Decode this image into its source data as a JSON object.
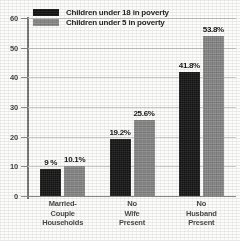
{
  "chart_data": {
    "type": "bar",
    "title": "",
    "subtitle": "",
    "xlabel": "",
    "ylabel": "",
    "ylim": [
      0,
      60
    ],
    "yticks": [
      0,
      10,
      20,
      30,
      40,
      50,
      60
    ],
    "ytick_labels": [
      "0",
      "10",
      "20",
      "30",
      "40",
      "50",
      "60"
    ],
    "grid": true,
    "legend_position": "top-left",
    "categories": [
      "Married-\nCouple\nHouseholds",
      "No\nWife\nPresent",
      "No\nHusband\nPresent"
    ],
    "series": [
      {
        "name": "Children under 18 in poverty",
        "color": "#1b1b1b",
        "values": [
          9,
          19.2,
          41.8
        ],
        "labels": [
          "9 %",
          "19.2%",
          "41.8%"
        ]
      },
      {
        "name": "Children under 5 in poverty",
        "color": "#8b8b8b",
        "values": [
          10.1,
          25.6,
          53.8
        ],
        "labels": [
          "10.1%",
          "25.6%",
          "53.8%"
        ]
      }
    ]
  },
  "legend": {
    "items": [
      {
        "label": "Children under 18 in poverty"
      },
      {
        "label": "Children under 5 in poverty"
      }
    ]
  }
}
